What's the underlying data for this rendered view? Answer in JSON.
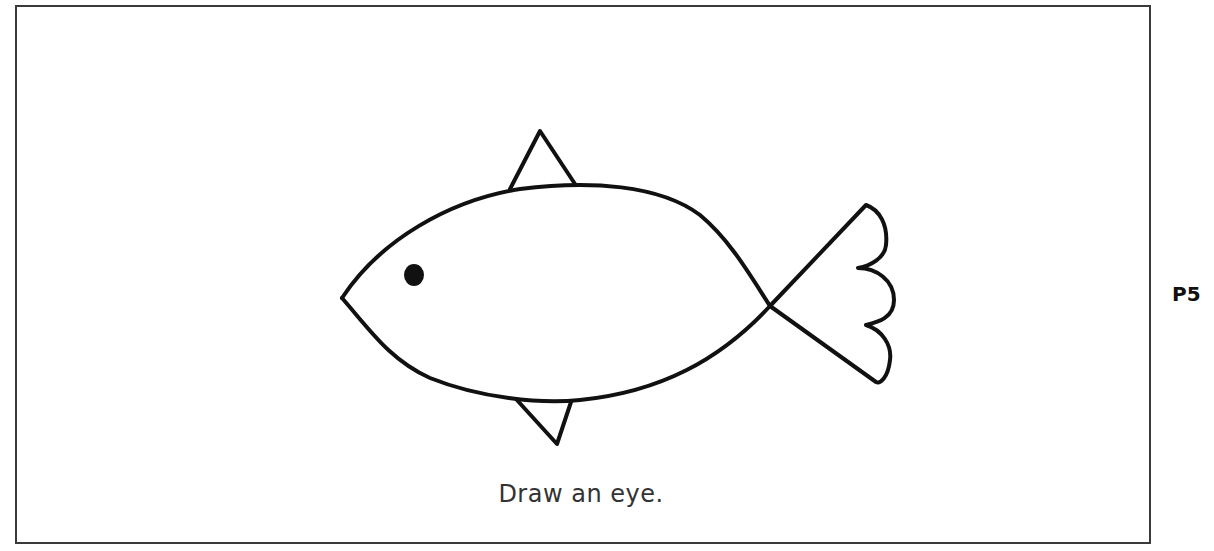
{
  "worksheet": {
    "instruction": "Draw an eye.",
    "page_label": "P5",
    "illustration": "fish outline",
    "stroke_color": "#111111",
    "border_color": "#3a3a3a"
  }
}
